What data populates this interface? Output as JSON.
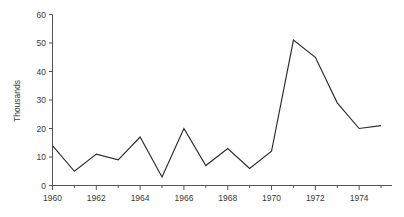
{
  "chart_data": {
    "type": "line",
    "title": "",
    "xlabel": "",
    "ylabel": "Thousands",
    "x": [
      1960,
      1961,
      1962,
      1963,
      1964,
      1965,
      1966,
      1967,
      1968,
      1969,
      1970,
      1971,
      1972,
      1973,
      1974,
      1975
    ],
    "values": [
      14,
      5,
      11,
      9,
      17,
      3,
      20,
      7,
      13,
      6,
      12,
      51,
      45,
      29,
      20,
      21
    ],
    "series": [
      {
        "name": "Thousands",
        "values": [
          14,
          5,
          11,
          9,
          17,
          3,
          20,
          7,
          13,
          6,
          12,
          51,
          45,
          29,
          20,
          21
        ]
      }
    ],
    "xlim": [
      1960,
      1975.5
    ],
    "ylim": [
      0,
      60
    ],
    "x_tick_labels": [
      "1960",
      "1962",
      "1964",
      "1966",
      "1968",
      "1970",
      "1972",
      "1974"
    ],
    "x_tick_values": [
      1960,
      1962,
      1964,
      1966,
      1968,
      1970,
      1972,
      1974
    ],
    "x_minor_tick_values": [
      1961,
      1963,
      1965,
      1967,
      1969,
      1971,
      1973,
      1975
    ],
    "y_tick_labels": [
      "0",
      "10",
      "20",
      "30",
      "40",
      "50",
      "60"
    ],
    "y_tick_values": [
      0,
      10,
      20,
      30,
      40,
      50,
      60
    ],
    "grid": false,
    "legend": false,
    "legend_position": "none",
    "line_color": "#2b2b2b",
    "axis_color": "#555555",
    "text_color": "#3a3a3a",
    "background_color": "#ffffff"
  }
}
